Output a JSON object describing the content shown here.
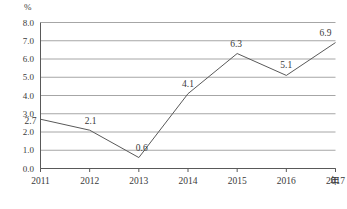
{
  "chart_data": {
    "type": "line",
    "title": "",
    "subtitle": "",
    "xlabel": "年",
    "ylabel": "%",
    "unit_label": "%",
    "categories": [
      "2011",
      "2012",
      "2013",
      "2014",
      "2015",
      "2016",
      "2017"
    ],
    "values": [
      2.7,
      2.1,
      0.6,
      4.1,
      6.3,
      5.1,
      6.9
    ],
    "series": [
      {
        "name": "",
        "values": [
          2.7,
          2.1,
          0.6,
          4.1,
          6.3,
          5.1,
          6.9
        ]
      }
    ],
    "point_labels": [
      "2.7",
      "2.1",
      "0.6",
      "4.1",
      "6.3",
      "5.1",
      "6.9"
    ],
    "ylim": [
      0.0,
      8.0
    ],
    "ytick_labels": [
      "8.0",
      "7.0",
      "6.0",
      "5.0",
      "4.0",
      "3.0",
      "2.0",
      "1.0",
      "0.0"
    ],
    "ytick_values": [
      8.0,
      7.0,
      6.0,
      5.0,
      4.0,
      3.0,
      2.0,
      1.0,
      0.0
    ],
    "grid": true,
    "grid_axis": "y",
    "legend": false,
    "legend_position": "none",
    "line_color": "#595959",
    "grid_color": "#a6a6a6",
    "axis_color": "#595959",
    "markers": false,
    "background": "#ffffff"
  }
}
